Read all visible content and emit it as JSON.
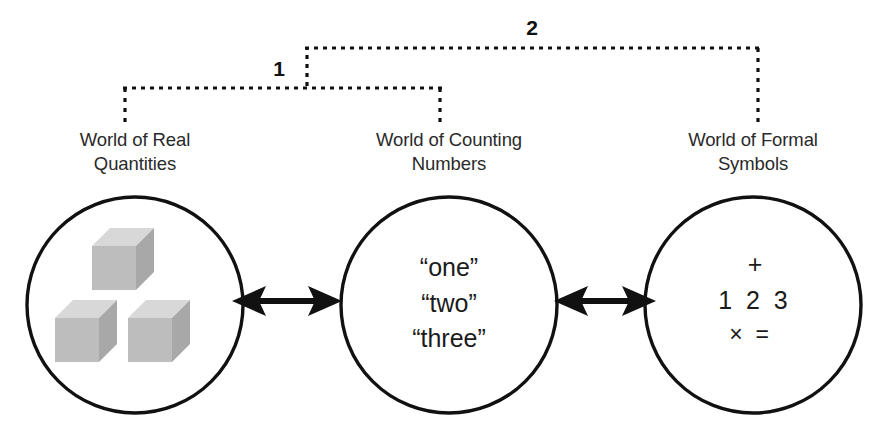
{
  "diagram": {
    "brackets": [
      {
        "id": "bracket-1",
        "label": "1"
      },
      {
        "id": "bracket-2",
        "label": "2"
      }
    ],
    "worlds": [
      {
        "id": "world-real-quantities",
        "label_line1": "World of Real",
        "label_line2": "Quantities",
        "content_kind": "cubes",
        "cube_count": 3
      },
      {
        "id": "world-counting-numbers",
        "label_line1": "World of Counting",
        "label_line2": "Numbers",
        "content_kind": "words",
        "lines": [
          "“one”",
          "“two”",
          "“three”"
        ]
      },
      {
        "id": "world-formal-symbols",
        "label_line1": "World of Formal",
        "label_line2": "Symbols",
        "content_kind": "symbols",
        "lines": [
          "+",
          "1  2  3",
          "×  ="
        ]
      }
    ],
    "connectors": [
      {
        "id": "arrow-real-to-counting",
        "kind": "double-headed-arrow"
      },
      {
        "id": "arrow-counting-to-formal",
        "kind": "double-headed-arrow"
      }
    ],
    "colors": {
      "ink": "#111111",
      "label_ink": "#2a2a2a",
      "circle_stroke": "#111111",
      "cube_front": "#bdbdbd",
      "cube_top": "#d6d6d6",
      "cube_side": "#a6a6a6",
      "background": "#ffffff"
    }
  }
}
